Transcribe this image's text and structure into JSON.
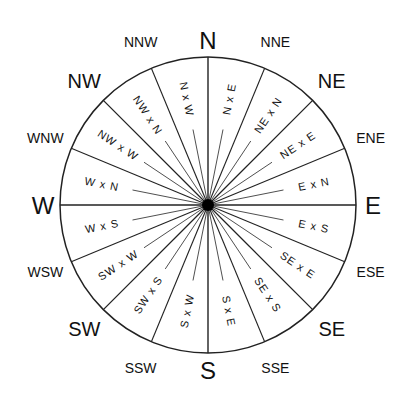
{
  "diagram": {
    "type": "compass-rose",
    "center": {
      "x": 208,
      "y": 205
    },
    "radius": 148,
    "line_color": "#222222",
    "label_color": "#111111",
    "cardinal": [
      {
        "label": "N",
        "angle": 0
      },
      {
        "label": "E",
        "angle": 90
      },
      {
        "label": "S",
        "angle": 180
      },
      {
        "label": "W",
        "angle": 270
      }
    ],
    "intercardinal": [
      {
        "label": "NE",
        "angle": 45
      },
      {
        "label": "SE",
        "angle": 135
      },
      {
        "label": "SW",
        "angle": 225
      },
      {
        "label": "NW",
        "angle": 315
      }
    ],
    "tertiary": [
      {
        "label": "NNE",
        "angle": 22.5
      },
      {
        "label": "ENE",
        "angle": 67.5
      },
      {
        "label": "ESE",
        "angle": 112.5
      },
      {
        "label": "SSE",
        "angle": 157.5
      },
      {
        "label": "SSW",
        "angle": 202.5
      },
      {
        "label": "WSW",
        "angle": 247.5
      },
      {
        "label": "WNW",
        "angle": 292.5
      },
      {
        "label": "NNW",
        "angle": 337.5
      }
    ],
    "by_points": [
      {
        "label": "N x E",
        "angle": 11.25
      },
      {
        "label": "NE x N",
        "angle": 33.75
      },
      {
        "label": "NE x E",
        "angle": 56.25
      },
      {
        "label": "E x N",
        "angle": 78.75
      },
      {
        "label": "E x S",
        "angle": 101.25
      },
      {
        "label": "SE x E",
        "angle": 123.75
      },
      {
        "label": "SE x S",
        "angle": 146.25
      },
      {
        "label": "S x E",
        "angle": 168.75
      },
      {
        "label": "S x W",
        "angle": 191.25
      },
      {
        "label": "SW x S",
        "angle": 213.75
      },
      {
        "label": "SW x W",
        "angle": 236.25
      },
      {
        "label": "W x S",
        "angle": 258.75
      },
      {
        "label": "W x N",
        "angle": 281.25
      },
      {
        "label": "NW x W",
        "angle": 303.75
      },
      {
        "label": "NW x N",
        "angle": 326.25
      },
      {
        "label": "N x W",
        "angle": 348.75
      }
    ]
  }
}
